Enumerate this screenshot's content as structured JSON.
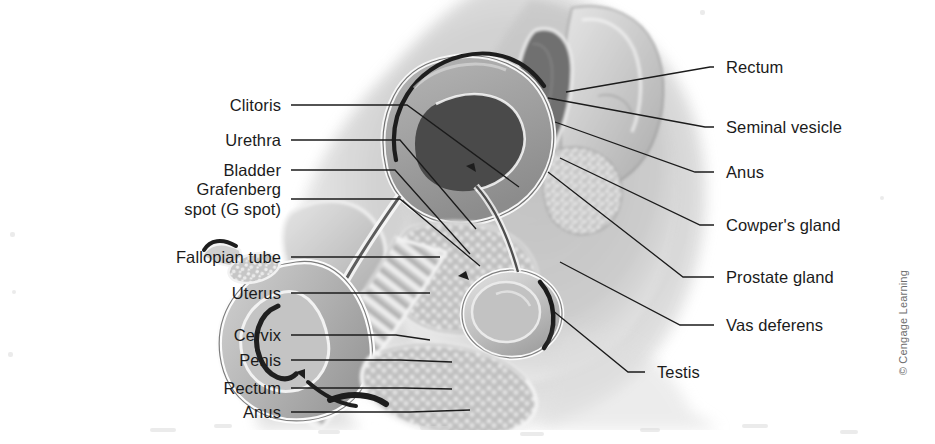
{
  "figure": {
    "copyright": "© Cengage Learning",
    "background_color": "#ffffff",
    "line_color": "#1b1b1b",
    "text_color": "#1b1b1b"
  },
  "labels_left": [
    {
      "id": "clitoris",
      "text": "Clitoris",
      "text_x": 281,
      "text_y": 105,
      "elbow_x": 407,
      "elbow_y": 105,
      "tip_x": 519,
      "tip_y": 187
    },
    {
      "id": "urethra",
      "text": "Urethra",
      "text_x": 281,
      "text_y": 140,
      "elbow_x": 400,
      "elbow_y": 140,
      "tip_x": 476,
      "tip_y": 229
    },
    {
      "id": "bladder",
      "text": "Bladder",
      "text_x": 281,
      "text_y": 170,
      "elbow_x": 395,
      "elbow_y": 170,
      "tip_x": 470,
      "tip_y": 254
    },
    {
      "id": "grafenberg-spot",
      "text": "Grafenberg",
      "text_x": 281,
      "text_y": 199,
      "line2": "spot (G spot)",
      "elbow_x": 400,
      "elbow_y": 199,
      "tip_x": 480,
      "tip_y": 266
    },
    {
      "id": "fallopian-tube",
      "text": "Fallopian tube",
      "text_x": 281,
      "text_y": 257,
      "elbow_x": 378,
      "elbow_y": 257,
      "tip_x": 440,
      "tip_y": 257
    },
    {
      "id": "uterus",
      "text": "Uterus",
      "text_x": 281,
      "text_y": 293,
      "elbow_x": 390,
      "elbow_y": 293,
      "tip_x": 430,
      "tip_y": 293
    },
    {
      "id": "cervix",
      "text": "Cervix",
      "text_x": 281,
      "text_y": 335,
      "elbow_x": 396,
      "elbow_y": 335,
      "tip_x": 430,
      "tip_y": 340
    },
    {
      "id": "penis",
      "text": "Penis",
      "text_x": 281,
      "text_y": 360,
      "elbow_x": 400,
      "elbow_y": 360,
      "tip_x": 452,
      "tip_y": 362
    },
    {
      "id": "rectum-left",
      "text": "Rectum",
      "text_x": 281,
      "text_y": 388,
      "elbow_x": 404,
      "elbow_y": 388,
      "tip_x": 452,
      "tip_y": 389
    },
    {
      "id": "anus-left",
      "text": "Anus",
      "text_x": 281,
      "text_y": 412,
      "elbow_x": 410,
      "elbow_y": 412,
      "tip_x": 470,
      "tip_y": 410
    }
  ],
  "labels_right": [
    {
      "id": "rectum-right",
      "text": "Rectum",
      "text_x": 726,
      "text_y": 67,
      "elbow_x": 710,
      "elbow_y": 67,
      "tip_x": 566,
      "tip_y": 92
    },
    {
      "id": "seminal-vesicle",
      "text": "Seminal vesicle",
      "text_x": 726,
      "text_y": 127,
      "elbow_x": 705,
      "elbow_y": 127,
      "tip_x": 548,
      "tip_y": 98
    },
    {
      "id": "anus-right",
      "text": "Anus",
      "text_x": 726,
      "text_y": 172,
      "elbow_x": 695,
      "elbow_y": 172,
      "tip_x": 555,
      "tip_y": 122
    },
    {
      "id": "cowpers-gland",
      "text": "Cowper's gland",
      "text_x": 726,
      "text_y": 225,
      "elbow_x": 700,
      "elbow_y": 225,
      "tip_x": 560,
      "tip_y": 158
    },
    {
      "id": "prostate-gland",
      "text": "Prostate gland",
      "text_x": 726,
      "text_y": 277,
      "elbow_x": 683,
      "elbow_y": 277,
      "tip_x": 548,
      "tip_y": 172
    },
    {
      "id": "vas-deferens",
      "text": "Vas deferens",
      "text_x": 726,
      "text_y": 325,
      "elbow_x": 680,
      "elbow_y": 325,
      "tip_x": 560,
      "tip_y": 262
    },
    {
      "id": "testis",
      "text": "Testis",
      "text_x": 657,
      "text_y": 372,
      "elbow_x": 628,
      "elbow_y": 372,
      "tip_x": 552,
      "tip_y": 310
    }
  ]
}
